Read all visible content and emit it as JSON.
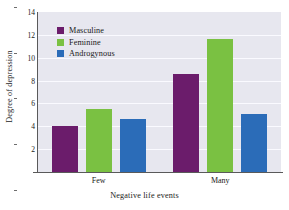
{
  "chart_data": {
    "type": "bar",
    "title": "",
    "subtitle": "",
    "xlabel": "Negative life events",
    "ylabel": "Degree of depression",
    "categories": [
      "Few",
      "Many"
    ],
    "series": [
      {
        "name": "Masculine",
        "values": [
          4.05,
          8.6
        ],
        "color": "#6B1C6B"
      },
      {
        "name": "Feminine",
        "values": [
          5.55,
          11.6
        ],
        "color": "#7AC142"
      },
      {
        "name": "Androgynous",
        "values": [
          4.6,
          5.1
        ],
        "color": "#2B6CB8"
      }
    ],
    "ylim": [
      0,
      14
    ],
    "yticks": [
      0,
      2,
      4,
      6,
      8,
      10,
      12,
      14
    ],
    "ytick_labels": [
      "",
      "2",
      "4",
      "6",
      "8",
      "10",
      "12",
      "14"
    ],
    "grid": true,
    "grid_axis": "y",
    "legend_position": "top-left",
    "plot_background": "#E7E7EF",
    "figure_background": "#FFFFFF",
    "axis_color": "#5A5A5A",
    "gridline_color": "#FAFAFF"
  }
}
